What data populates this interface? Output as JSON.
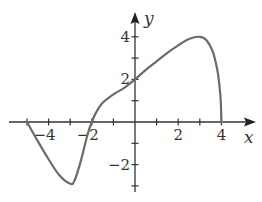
{
  "chart_data": {
    "type": "line",
    "title": "",
    "xlabel": "x",
    "ylabel": "y",
    "xlim": [
      -5.8,
      5.6
    ],
    "ylim": [
      -3.3,
      5.0
    ],
    "grid": false,
    "legend": null,
    "x_ticks": [
      -5,
      -4,
      -3,
      -2,
      -1,
      1,
      2,
      3,
      4
    ],
    "x_tick_labels": [
      {
        "value": -4,
        "label": "−4"
      },
      {
        "value": -2,
        "label": "−2"
      },
      {
        "value": 2,
        "label": "2"
      },
      {
        "value": 4,
        "label": "4"
      }
    ],
    "y_ticks": [
      -3,
      -2,
      -1,
      1,
      2,
      3,
      4
    ],
    "y_tick_labels": [
      {
        "value": 4,
        "label": "4"
      },
      {
        "value": 2,
        "label": "2"
      },
      {
        "value": -2,
        "label": "−2"
      }
    ],
    "series": [
      {
        "name": "f(x)",
        "color": "#6b6b6b",
        "x": [
          -5.0,
          -4.5,
          -4.0,
          -3.5,
          -3.0,
          -2.8,
          -2.5,
          -2.2,
          -2.0,
          -1.8,
          -1.5,
          -1.0,
          -0.5,
          0.0,
          0.5,
          1.0,
          1.5,
          2.0,
          2.5,
          3.0,
          3.3,
          3.6,
          3.8,
          3.9,
          3.97,
          4.0
        ],
        "y": [
          0.0,
          -0.9,
          -1.75,
          -2.5,
          -2.9,
          -2.75,
          -1.8,
          -0.6,
          0.0,
          0.45,
          0.9,
          1.3,
          1.6,
          2.0,
          2.45,
          2.85,
          3.25,
          3.6,
          3.9,
          4.0,
          3.85,
          3.3,
          2.5,
          1.8,
          1.0,
          0.0
        ]
      }
    ]
  }
}
